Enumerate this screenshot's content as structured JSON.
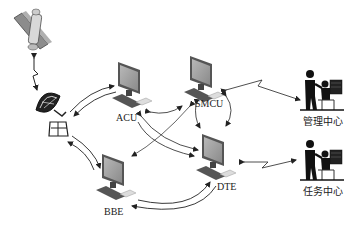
{
  "diagram": {
    "title": "",
    "nodes": [
      {
        "id": "satellite",
        "label": "",
        "icon": "satellite-icon"
      },
      {
        "id": "antenna",
        "label": "",
        "icon": "dish-antenna-icon"
      },
      {
        "id": "acu",
        "label": "ACU",
        "icon": "computer-icon"
      },
      {
        "id": "smcu",
        "label": "SMCU",
        "icon": "computer-icon"
      },
      {
        "id": "bbe",
        "label": "BBE",
        "icon": "computer-icon"
      },
      {
        "id": "dte",
        "label": "DTE",
        "icon": "computer-icon"
      },
      {
        "id": "mgmt",
        "label": "管理中心",
        "icon": "operator-workstation-icon"
      },
      {
        "id": "mission",
        "label": "任务中心",
        "icon": "operator-workstation-icon"
      }
    ],
    "links": [
      {
        "from": "satellite",
        "to": "antenna",
        "type": "wireless",
        "direction": "both"
      },
      {
        "from": "antenna",
        "to": "acu",
        "type": "curved",
        "direction": "both"
      },
      {
        "from": "antenna",
        "to": "bbe",
        "type": "curved",
        "direction": "both"
      },
      {
        "from": "acu",
        "to": "smcu",
        "type": "curved",
        "direction": "both"
      },
      {
        "from": "acu",
        "to": "dte",
        "type": "curved",
        "direction": "both"
      },
      {
        "from": "smcu",
        "to": "bbe",
        "type": "curved",
        "direction": "both"
      },
      {
        "from": "smcu",
        "to": "dte",
        "type": "curved",
        "direction": "both"
      },
      {
        "from": "bbe",
        "to": "dte",
        "type": "curved",
        "direction": "both"
      },
      {
        "from": "smcu",
        "to": "mgmt",
        "type": "wireless",
        "direction": "both"
      },
      {
        "from": "dte",
        "to": "mission",
        "type": "wireless",
        "direction": "both"
      }
    ]
  }
}
